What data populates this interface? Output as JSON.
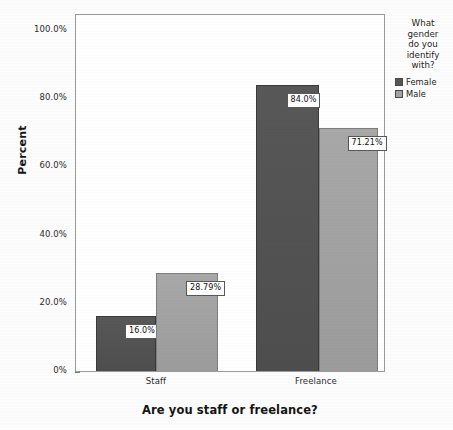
{
  "chart_data": {
    "type": "bar",
    "title": "",
    "xlabel": "Are you staff or freelance?",
    "ylabel": "Percent",
    "categories": [
      "Staff",
      "Freelance"
    ],
    "series": [
      {
        "name": "Female",
        "color": "#555555",
        "values": [
          16.0,
          84.0
        ],
        "labels": [
          "16.0%",
          "84.0%"
        ]
      },
      {
        "name": "Male",
        "color": "#a3a3a3",
        "values": [
          28.79,
          71.21
        ],
        "labels": [
          "28.79%",
          "71.21%"
        ]
      }
    ],
    "ylim": [
      0,
      105
    ],
    "yticks": [
      0,
      20,
      40,
      60,
      80,
      100
    ],
    "ytick_labels": [
      "0%",
      "20.0%",
      "40.0%",
      "60.0%",
      "80.0%",
      "100.0%"
    ],
    "grid": false,
    "legend_position": "right"
  },
  "axes": {
    "y_title": "Percent",
    "x_title": "Are you staff or freelance?",
    "y_ticks": [
      {
        "value": 100,
        "label": "100.0%"
      },
      {
        "value": 80,
        "label": "80.0%"
      },
      {
        "value": 60,
        "label": "60.0%"
      },
      {
        "value": 40,
        "label": "40.0%"
      },
      {
        "value": 20,
        "label": "20.0%"
      },
      {
        "value": 0,
        "label": "0%"
      }
    ],
    "x_categories": [
      {
        "label": "Staff"
      },
      {
        "label": "Freelance"
      }
    ]
  },
  "legend": {
    "title": "What gender do you identify with?",
    "title_lines": [
      "What",
      "gender",
      "do you",
      "identify",
      "with?"
    ],
    "items": [
      {
        "label": "Female",
        "color": "#555555"
      },
      {
        "label": "Male",
        "color": "#a3a3a3"
      }
    ]
  },
  "bars": [
    {
      "group": "Staff",
      "series": "Female",
      "value": 16.0,
      "label": "16.0%"
    },
    {
      "group": "Staff",
      "series": "Male",
      "value": 28.79,
      "label": "28.79%"
    },
    {
      "group": "Freelance",
      "series": "Female",
      "value": 84.0,
      "label": "84.0%"
    },
    {
      "group": "Freelance",
      "series": "Male",
      "value": 71.21,
      "label": "71.21%"
    }
  ]
}
